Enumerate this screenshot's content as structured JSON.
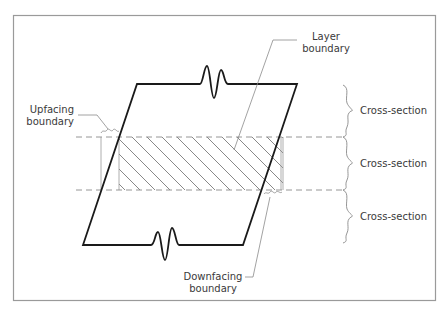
{
  "labels": {
    "layer_boundary_line1": "Layer",
    "layer_boundary_line2": "boundary",
    "upfacing_line1": "Upfacing",
    "upfacing_line2": "boundary",
    "downfacing_line1": "Downfacing",
    "downfacing_line2": "boundary",
    "cross_sections": [
      "Cross-section",
      "Cross-section",
      "Cross-section"
    ]
  },
  "colors": {
    "outline": "#1a1a1a",
    "thin": "#8a8a8a",
    "border": "#9a9a9a",
    "text": "#3a3a3a"
  }
}
